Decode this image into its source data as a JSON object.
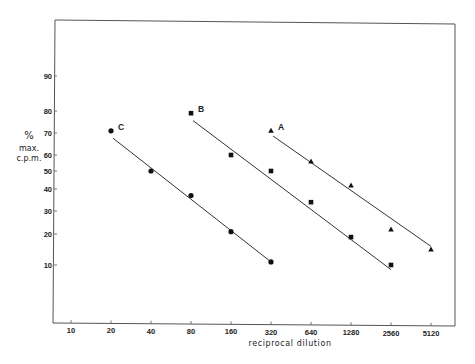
{
  "chart_data": {
    "type": "scatter",
    "title": "",
    "xlabel": "reciprocal dilution",
    "ylabel": [
      "%",
      "max.",
      "c.p.m."
    ],
    "x_scale": "log2",
    "y_scale": "probability",
    "x_ticks": [
      10,
      20,
      40,
      80,
      160,
      320,
      640,
      1280,
      2560,
      5120
    ],
    "y_ticks": [
      10,
      20,
      30,
      40,
      50,
      60,
      70,
      80,
      90
    ],
    "grid": false,
    "legend": "inline-labels",
    "series": [
      {
        "name": "C",
        "marker": "circle",
        "points": [
          [
            20,
            71
          ],
          [
            40,
            50
          ],
          [
            80,
            37
          ],
          [
            160,
            21
          ],
          [
            320,
            11
          ]
        ],
        "fit": [
          [
            20,
            69
          ],
          [
            320,
            11
          ]
        ]
      },
      {
        "name": "B",
        "marker": "square",
        "points": [
          [
            80,
            79
          ],
          [
            160,
            60
          ],
          [
            320,
            50
          ],
          [
            640,
            34
          ],
          [
            1280,
            19
          ],
          [
            2560,
            10
          ]
        ],
        "fit": [
          [
            80,
            77
          ],
          [
            2560,
            8.5
          ]
        ]
      },
      {
        "name": "A",
        "marker": "triangle",
        "points": [
          [
            320,
            71
          ],
          [
            640,
            56
          ],
          [
            1280,
            42
          ],
          [
            2560,
            22
          ],
          [
            5120,
            15
          ]
        ],
        "fit": [
          [
            320,
            70
          ],
          [
            5120,
            16
          ]
        ]
      }
    ]
  }
}
